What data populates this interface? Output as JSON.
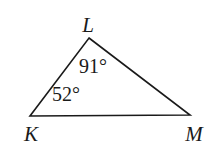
{
  "figure": {
    "type": "triangle-diagram",
    "background_color": "#ffffff",
    "stroke_color": "#1a1a1a",
    "text_color": "#1a1a1a",
    "vertices": [
      {
        "name": "L",
        "label": "L",
        "x": 89,
        "y": 38
      },
      {
        "name": "K",
        "label": "K",
        "x": 30,
        "y": 116
      },
      {
        "name": "M",
        "label": "M",
        "x": 190,
        "y": 115
      }
    ],
    "labels": {
      "vertex_L": "L",
      "vertex_K": "K",
      "vertex_M": "M"
    },
    "angles": [
      {
        "at_vertex": "L",
        "value": 91,
        "unit": "degree",
        "text": "91°"
      },
      {
        "at_vertex": "K",
        "value": 52,
        "unit": "degree",
        "text": "52°"
      }
    ],
    "angle_text": {
      "at_L": "91°",
      "at_K": "52°"
    },
    "sides": [
      {
        "from": "K",
        "to": "L"
      },
      {
        "from": "L",
        "to": "M"
      },
      {
        "from": "K",
        "to": "M"
      }
    ],
    "polygon_points": "89,38 190,115 30,116"
  }
}
